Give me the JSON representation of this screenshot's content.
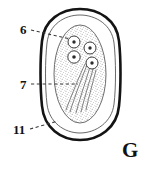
{
  "figure": {
    "panel_letter": "G",
    "background_color": "#ffffff",
    "ink_color": "#111111",
    "stipple_color": "#8a8a8a",
    "leader_color": "#4a4a4a",
    "labels": [
      {
        "id": "6",
        "text": "6",
        "target": "embryonic-nuclei"
      },
      {
        "id": "7",
        "text": "7",
        "target": "oncosphere-hooklets"
      },
      {
        "id": "11",
        "text": "11",
        "target": "outer-shell"
      }
    ],
    "structures": {
      "outer_shell": "thick-dark-oval-outline",
      "inner_membrane": "thin-oval-outline",
      "embryophore": "stippled-inner-oval-mass",
      "nuclei_count": 4,
      "hooklet_lines": 5
    }
  }
}
